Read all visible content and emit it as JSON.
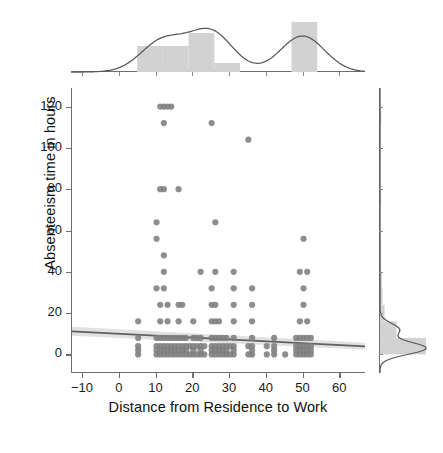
{
  "chart_data": {
    "type": "scatter",
    "title": "",
    "subtitle": "",
    "xlabel": "Distance from Residence to Work",
    "ylabel": "Absenteeism time in hours",
    "xlim": [
      -13,
      67
    ],
    "ylim": [
      -9,
      129
    ],
    "xticks": [
      -10,
      0,
      10,
      20,
      30,
      40,
      50,
      60
    ],
    "xticklabels": [
      "−10",
      "0",
      "10",
      "20",
      "30",
      "40",
      "50",
      "60"
    ],
    "yticks": [
      0,
      20,
      40,
      60,
      80,
      100,
      120
    ],
    "yticklabels": [
      "0",
      "20",
      "40",
      "60",
      "80",
      "100",
      "120"
    ],
    "grid": false,
    "legend": null,
    "marker_color": "#7e7e7e",
    "hist_color": "#d2d2d2",
    "kde_color": "#575757",
    "regression_color": "#5f5f5f",
    "ci_color": "#c9c9c9",
    "regression": {
      "note": "slight negative slope fit line with shaded confidence band",
      "x_endpoints": [
        -13,
        67
      ],
      "y_endpoints": [
        11.2,
        3.9
      ],
      "slope": -0.091,
      "intercept": 10.0,
      "ci_at_x_endpoints": [
        [
          9.0,
          13.4
        ],
        [
          2.2,
          5.6
        ]
      ]
    },
    "points": [
      [
        11,
        120
      ],
      [
        12,
        120
      ],
      [
        13,
        120
      ],
      [
        14,
        120
      ],
      [
        12,
        112
      ],
      [
        25,
        112
      ],
      [
        35,
        104
      ],
      [
        11,
        80
      ],
      [
        12,
        80
      ],
      [
        16,
        80
      ],
      [
        10,
        64
      ],
      [
        26,
        64
      ],
      [
        10,
        56
      ],
      [
        50,
        56
      ],
      [
        12,
        48
      ],
      [
        12,
        40
      ],
      [
        22,
        40
      ],
      [
        26,
        40
      ],
      [
        31,
        40
      ],
      [
        49,
        40
      ],
      [
        51,
        40
      ],
      [
        10,
        32
      ],
      [
        12,
        32
      ],
      [
        25,
        32
      ],
      [
        31,
        32
      ],
      [
        36,
        32
      ],
      [
        50,
        32
      ],
      [
        11,
        24
      ],
      [
        13,
        24
      ],
      [
        16,
        24
      ],
      [
        17,
        24
      ],
      [
        25,
        24
      ],
      [
        26,
        24
      ],
      [
        31,
        24
      ],
      [
        36,
        24
      ],
      [
        50,
        24
      ],
      [
        5,
        16
      ],
      [
        11,
        16
      ],
      [
        13,
        16
      ],
      [
        16,
        16
      ],
      [
        20,
        16
      ],
      [
        25,
        16
      ],
      [
        26,
        16
      ],
      [
        27,
        16
      ],
      [
        31,
        16
      ],
      [
        36,
        16
      ],
      [
        49,
        16
      ],
      [
        51,
        16
      ],
      [
        5,
        8
      ],
      [
        10,
        8
      ],
      [
        11,
        8
      ],
      [
        12,
        8
      ],
      [
        13,
        8
      ],
      [
        14,
        8
      ],
      [
        15,
        8
      ],
      [
        16,
        8
      ],
      [
        17,
        8
      ],
      [
        18,
        8
      ],
      [
        20,
        8
      ],
      [
        21,
        8
      ],
      [
        22,
        8
      ],
      [
        25,
        8
      ],
      [
        26,
        8
      ],
      [
        27,
        8
      ],
      [
        28,
        8
      ],
      [
        29,
        8
      ],
      [
        31,
        8
      ],
      [
        36,
        8
      ],
      [
        42,
        8
      ],
      [
        48,
        8
      ],
      [
        49,
        8
      ],
      [
        50,
        8
      ],
      [
        51,
        8
      ],
      [
        52,
        8
      ],
      [
        5,
        4
      ],
      [
        10,
        4
      ],
      [
        11,
        4
      ],
      [
        12,
        4
      ],
      [
        13,
        4
      ],
      [
        14,
        4
      ],
      [
        15,
        4
      ],
      [
        16,
        4
      ],
      [
        17,
        4
      ],
      [
        18,
        4
      ],
      [
        19,
        4
      ],
      [
        20,
        4
      ],
      [
        21,
        4
      ],
      [
        22,
        4
      ],
      [
        23,
        4
      ],
      [
        25,
        4
      ],
      [
        26,
        4
      ],
      [
        27,
        4
      ],
      [
        28,
        4
      ],
      [
        29,
        4
      ],
      [
        30,
        4
      ],
      [
        31,
        4
      ],
      [
        35,
        4
      ],
      [
        36,
        4
      ],
      [
        40,
        4
      ],
      [
        42,
        4
      ],
      [
        48,
        4
      ],
      [
        49,
        4
      ],
      [
        50,
        4
      ],
      [
        51,
        4
      ],
      [
        52,
        4
      ],
      [
        5,
        2
      ],
      [
        10,
        2
      ],
      [
        11,
        2
      ],
      [
        12,
        2
      ],
      [
        13,
        2
      ],
      [
        14,
        2
      ],
      [
        15,
        2
      ],
      [
        16,
        2
      ],
      [
        17,
        2
      ],
      [
        18,
        2
      ],
      [
        20,
        2
      ],
      [
        22,
        2
      ],
      [
        25,
        2
      ],
      [
        26,
        2
      ],
      [
        27,
        2
      ],
      [
        28,
        2
      ],
      [
        29,
        2
      ],
      [
        31,
        2
      ],
      [
        36,
        2
      ],
      [
        42,
        2
      ],
      [
        48,
        2
      ],
      [
        49,
        2
      ],
      [
        50,
        2
      ],
      [
        51,
        2
      ],
      [
        52,
        2
      ],
      [
        5,
        0
      ],
      [
        10,
        0
      ],
      [
        11,
        0
      ],
      [
        12,
        0
      ],
      [
        13,
        0
      ],
      [
        14,
        0
      ],
      [
        15,
        0
      ],
      [
        16,
        0
      ],
      [
        17,
        0
      ],
      [
        18,
        0
      ],
      [
        19,
        0
      ],
      [
        20,
        0
      ],
      [
        21,
        0
      ],
      [
        22,
        0
      ],
      [
        23,
        0
      ],
      [
        25,
        0
      ],
      [
        26,
        0
      ],
      [
        27,
        0
      ],
      [
        28,
        0
      ],
      [
        29,
        0
      ],
      [
        30,
        0
      ],
      [
        31,
        0
      ],
      [
        35,
        0
      ],
      [
        36,
        0
      ],
      [
        40,
        0
      ],
      [
        42,
        0
      ],
      [
        45,
        0
      ],
      [
        48,
        0
      ],
      [
        49,
        0
      ],
      [
        50,
        0
      ],
      [
        51,
        0
      ],
      [
        52,
        0
      ]
    ],
    "marginal_x": {
      "type": "histogram+kde",
      "bin_edges": [
        5,
        12,
        19,
        26,
        33,
        40,
        47,
        54
      ],
      "bin_counts": [
        0.52,
        0.52,
        0.78,
        0.18,
        0.0,
        0.0,
        1.0
      ],
      "kde_peaks_x": [
        12,
        25,
        50
      ],
      "kde_peak_heights": [
        0.62,
        0.8,
        0.72
      ]
    },
    "marginal_y": {
      "type": "histogram+kde",
      "bin_edges": [
        0,
        8,
        16,
        24,
        32,
        40,
        48,
        56,
        64,
        72,
        80,
        88,
        96,
        104,
        112,
        120
      ],
      "bin_counts": [
        1.0,
        0.36,
        0.1,
        0.06,
        0.04,
        0.02,
        0.02,
        0.0,
        0.0,
        0.02,
        0.0,
        0.0,
        0.01,
        0.01,
        0.03
      ],
      "kde_peaks_y": [
        3,
        12
      ],
      "kde_peak_heights": [
        1.0,
        0.42
      ]
    }
  }
}
